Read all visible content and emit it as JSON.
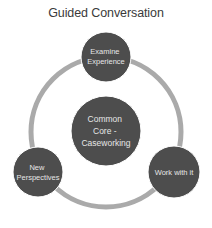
{
  "title": "Guided Conversation",
  "colors": {
    "ring": "#aaaaaa",
    "node_fill": "#4d4d4d",
    "node_stroke": "#ffffff",
    "text": "#e6e6e6",
    "title": "#3a3a3a"
  },
  "center_node": {
    "lines": [
      "Common",
      "Core -",
      "Caseworking"
    ]
  },
  "cycle_nodes": [
    {
      "id": "examine-experience",
      "lines": [
        "Examine",
        "Experience"
      ],
      "position": "top"
    },
    {
      "id": "work-with-it",
      "lines": [
        "Work with it"
      ],
      "position": "bottom-right"
    },
    {
      "id": "new-perspectives",
      "lines": [
        "New",
        "Perspectives"
      ],
      "position": "bottom-left"
    }
  ]
}
